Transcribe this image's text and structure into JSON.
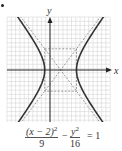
{
  "chart_data": {
    "type": "line",
    "title": "",
    "equation": "(x - 2)^2/9 - y^2/16 = 1",
    "xlabel": "x",
    "ylabel": "y",
    "grid": true,
    "xlim": [
      -8,
      12
    ],
    "ylim": [
      -10,
      10
    ],
    "center": [
      2,
      0
    ],
    "a": 3,
    "b": 4,
    "vertices": [
      [
        -1,
        0
      ],
      [
        5,
        0
      ]
    ],
    "asymptotes": [
      "y = (4/3)(x - 2)",
      "y = -(4/3)(x - 2)"
    ],
    "fundamental_rectangle": {
      "x": [
        -1,
        5
      ],
      "y": [
        -4,
        4
      ]
    },
    "series": [
      {
        "name": "hyperbola",
        "style": "solid"
      },
      {
        "name": "asymptotes",
        "style": "dashed"
      },
      {
        "name": "rectangle",
        "style": "dashed"
      }
    ]
  },
  "labels": {
    "x_axis": "x",
    "y_axis": "y",
    "eq_num1": "(x − 2)",
    "eq_exp1": "2",
    "eq_den1": "9",
    "eq_minus": "−",
    "eq_num2": "y",
    "eq_exp2": "2",
    "eq_den2": "16",
    "eq_rhs": "= 1"
  }
}
